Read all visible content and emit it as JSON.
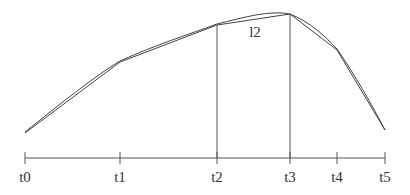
{
  "diagram": {
    "type": "piecewise-linear-approximation",
    "curve_color": "#444444",
    "axis_color": "#555555",
    "segment_label": {
      "text": "l2",
      "x": 255,
      "y": 37
    },
    "axis": {
      "y": 158,
      "x_start": 25,
      "x_end": 385,
      "tick_height": 6
    },
    "ticks": [
      {
        "label": "t0",
        "x": 25
      },
      {
        "label": "t1",
        "x": 120
      },
      {
        "label": "t2",
        "x": 217
      },
      {
        "label": "t3",
        "x": 290
      },
      {
        "label": "t4",
        "x": 337
      },
      {
        "label": "t5",
        "x": 385
      }
    ],
    "polyline_points": [
      [
        25,
        133
      ],
      [
        120,
        62
      ],
      [
        217,
        25
      ],
      [
        290,
        14
      ],
      [
        337,
        50
      ],
      [
        385,
        130
      ]
    ],
    "smooth_curve_path": "M25,132 C60,104 95,76 120,61 C155,45 190,34 217,24 C245,17 270,10 290,14 C310,22 325,36 337,49 C355,75 372,105 385,130",
    "verticals": [
      {
        "x": 217,
        "y_top": 25,
        "y_bottom": 158
      },
      {
        "x": 290,
        "y_top": 14,
        "y_bottom": 158
      }
    ]
  }
}
